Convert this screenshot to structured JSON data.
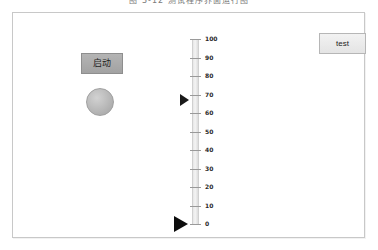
{
  "caption": {
    "text": "图 3-12    测试程序界面运行图"
  },
  "panel": {
    "start_button": {
      "label": "启动",
      "icon": "start-button"
    },
    "status_lamp": {
      "icon": "round-indicator-lamp",
      "state": "off",
      "color": "#b0b0b0"
    },
    "test_button": {
      "label": "test"
    }
  },
  "gauge": {
    "orientation": "vertical",
    "min": 0,
    "max": 100,
    "tick_step": 10,
    "tick_labels": [
      "100",
      "90",
      "80",
      "70",
      "60",
      "50",
      "40",
      "30",
      "20",
      "10",
      "0"
    ],
    "pointer_value": 67,
    "pointer_min_value": 0,
    "pointer_icon": "triangle-right-pointer",
    "pointer_min_icon": "triangle-right-pointer-large"
  },
  "colors": {
    "panel_border": "#c8c8c8",
    "panel_background": "#ffffff",
    "start_button_face": "#aaaaaa",
    "lamp_face": "#b0b0b0",
    "pointer": "#111111",
    "tick": "#9a9a9a"
  },
  "chart_data": {
    "type": "bar",
    "title": "",
    "xlabel": "",
    "ylabel": "",
    "categories": [
      "value",
      "minimum"
    ],
    "values": [
      67,
      0
    ],
    "ylim": [
      0,
      100
    ]
  }
}
